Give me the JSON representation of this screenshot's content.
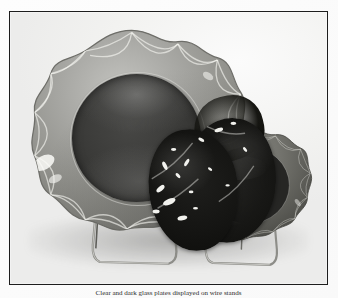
{
  "page": {
    "background_color": "#fbfbfa",
    "bleed_through_text": "PLATE COLLECTION CATALOG GLASSWARE"
  },
  "figure": {
    "type": "photograph",
    "medium": "black-and-white halftone print",
    "frame_color": "#1d1d1d",
    "caption": "Clear and dark glass plates displayed on wire stands"
  },
  "objects": [
    {
      "name": "large-scalloped-plate",
      "label": "Large scalloped-rim plate",
      "position": "left-rear",
      "rim_style": "scalloped with crossed arc cutting",
      "rim_tone": "#9a9a97",
      "center_tone": "#3a3a38",
      "scallop_count": 14
    },
    {
      "name": "medium-dark-plate",
      "label": "Medium dark plate",
      "position": "right-front",
      "rim_style": "scalloped with crossed arc cutting",
      "rim_tone": "#6f6f6c",
      "center_tone": "#2a2a28",
      "scallop_count": 12
    },
    {
      "name": "dark-glass-plate-front",
      "label": "Dark glass plate",
      "position": "center-front",
      "rim_style": "irregular textured",
      "center_tone": "#141412"
    },
    {
      "name": "dark-glass-plate-upper",
      "label": "Dark glass plate",
      "position": "center-upper",
      "rim_style": "irregular textured",
      "center_tone": "#16161 2"
    }
  ],
  "stands": [
    {
      "name": "wire-stand-left",
      "label": "Wire plate stand",
      "wire_tone": "#8d8d88"
    },
    {
      "name": "wire-stand-right",
      "label": "Wire plate stand",
      "wire_tone": "#8d8d88"
    }
  ]
}
